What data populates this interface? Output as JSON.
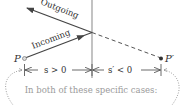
{
  "diagram": {
    "labels": {
      "outgoing": "Outgoing",
      "incoming": "Incoming",
      "object_point": "P",
      "image_point": "P′",
      "object_distance": "s > 0",
      "image_distance": "s′ < 0"
    },
    "caption": "In both of these specific cases:",
    "colors": {
      "ray": "#444444",
      "surface": "#9a9a9a",
      "dashed": "#555555",
      "dotted": "#888888",
      "caption": "#9a9a9a"
    }
  }
}
